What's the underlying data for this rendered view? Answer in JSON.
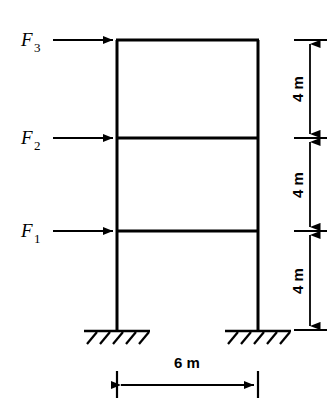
{
  "figure": {
    "stroke_color": "#000000",
    "background_color": "#ffffff"
  },
  "forces": [
    {
      "name": "force-f3",
      "symbol": "F",
      "subscript": "3",
      "level": "roof"
    },
    {
      "name": "force-f2",
      "symbol": "F",
      "subscript": "2",
      "level": "second-floor"
    },
    {
      "name": "force-f1",
      "symbol": "F",
      "subscript": "1",
      "level": "first-floor"
    }
  ],
  "vertical_dimensions": [
    {
      "label": "4 m",
      "segment": "roof-to-second-floor"
    },
    {
      "label": "4 m",
      "segment": "second-floor-to-first-floor"
    },
    {
      "label": "4 m",
      "segment": "first-floor-to-base"
    }
  ],
  "span_dimension": {
    "label": "6 m",
    "segment": "left-column-to-right-column"
  },
  "supports": [
    {
      "name": "left-support",
      "type": "fixed"
    },
    {
      "name": "right-support",
      "type": "fixed"
    }
  ],
  "geometry": {
    "left_column_x": 117,
    "right_column_x": 258,
    "roof_y": 40,
    "second_floor_y": 138,
    "first_floor_y": 231,
    "base_y": 330,
    "dimension_line_x": 310,
    "span_dimension_y": 385
  }
}
